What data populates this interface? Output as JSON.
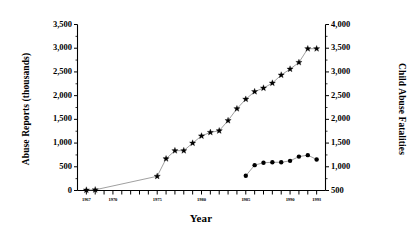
{
  "chart_data": {
    "type": "line",
    "title": "",
    "xlabel": "Year",
    "grid": false,
    "legend": "none",
    "x": [
      1967,
      1968,
      1969,
      1970,
      1971,
      1972,
      1973,
      1974,
      1975,
      1976,
      1977,
      1978,
      1979,
      1980,
      1981,
      1982,
      1983,
      1984,
      1985,
      1986,
      1987,
      1988,
      1989,
      1990,
      1991,
      1992,
      1993
    ],
    "xlim": [
      1966,
      1994
    ],
    "xticks": [
      1967,
      1970,
      1975,
      1980,
      1985,
      1990,
      1993
    ],
    "xtick_labels": [
      "1967",
      "1970",
      "1975",
      "1980",
      "1985",
      "1990",
      "1993"
    ],
    "axes": [
      {
        "id": "left",
        "label": "Abuse Reports (thousands)",
        "ylim": [
          0,
          3500
        ],
        "yticks": [
          0,
          500,
          1000,
          1500,
          2000,
          2500,
          3000,
          3500
        ],
        "ytick_labels": [
          "0",
          "500",
          "1,000",
          "1,500",
          "2,000",
          "2,500",
          "3,000",
          "3,500"
        ]
      },
      {
        "id": "right",
        "label": "Child Abuse Fatalities",
        "ylim": [
          500,
          4000
        ],
        "yticks": [
          500,
          1000,
          1500,
          2000,
          2500,
          3000,
          3500,
          4000
        ],
        "ytick_labels": [
          "500",
          "1,000",
          "1,500",
          "2,000",
          "2,500",
          "3,000",
          "3,500",
          "4,000"
        ]
      }
    ],
    "series": [
      {
        "name": "Abuse Reports (thousands)",
        "axis": "left",
        "marker": "star",
        "color": "#000000",
        "x": [
          1967,
          1968,
          1975,
          1976,
          1977,
          1978,
          1979,
          1980,
          1981,
          1982,
          1983,
          1984,
          1985,
          1986,
          1987,
          1988,
          1989,
          1990,
          1991,
          1992,
          1993
        ],
        "values": [
          10,
          15,
          300,
          670,
          840,
          840,
          1000,
          1150,
          1225,
          1260,
          1475,
          1725,
          1925,
          2085,
          2160,
          2265,
          2435,
          2560,
          2700,
          2990,
          2990
        ]
      },
      {
        "name": "Child Abuse Fatalities",
        "axis": "right",
        "marker": "dot",
        "color": "#000000",
        "x": [
          1985,
          1986,
          1987,
          1988,
          1989,
          1990,
          1991,
          1992,
          1993
        ],
        "values": [
          810,
          1035,
          1085,
          1095,
          1095,
          1125,
          1215,
          1245,
          1155
        ]
      }
    ]
  }
}
